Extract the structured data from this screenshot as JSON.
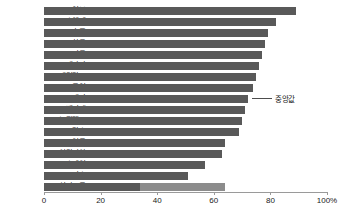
{
  "chart_data": {
    "type": "bar",
    "orientation": "horizontal",
    "title": "",
    "subtitle": "",
    "xlabel": "",
    "ylabel": "",
    "xlim": [
      0,
      100
    ],
    "xticks": [
      0,
      20,
      40,
      60,
      80,
      100
    ],
    "xtick_labels": [
      "0",
      "20",
      "40",
      "60",
      "80",
      "100%"
    ],
    "grid": false,
    "legend": false,
    "categories": [
      "일본",
      "스웨덴",
      "호주",
      "한국",
      "미국",
      "캐나다",
      "네덜란드",
      "독일",
      "대만",
      "벨기에",
      "뉴질랜드",
      "프랑스",
      "영국",
      "이탈리아",
      "스페인",
      "그리스",
      "싱가포르"
    ],
    "values": [
      89,
      82,
      79,
      78,
      77,
      76,
      75,
      74,
      72,
      71,
      70,
      69,
      64,
      63,
      57,
      51,
      64
    ],
    "bar_color": "#595959",
    "last_bar_color": "#757575",
    "segment_split": {
      "싱가포르": {
        "first": 34,
        "second": 64,
        "second_color": "#8c8c8c"
      }
    },
    "annotations": [
      {
        "label": "중앙값",
        "target_category": "대만",
        "target_value": 72
      }
    ],
    "axis_color": "#9a9a9a",
    "background": "#ffffff"
  }
}
